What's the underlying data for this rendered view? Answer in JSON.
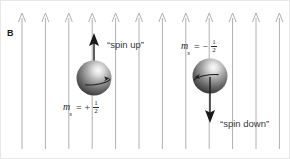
{
  "figure": {
    "panel_letter": "B",
    "background_color": "#ffffff",
    "width": 290,
    "height": 159
  },
  "magnetic_field": {
    "label": "B",
    "line_color": "#b0b0b0",
    "arrow_color": "#a8a8a8",
    "direction": "up",
    "line_count": 11,
    "line_top_y": 12,
    "line_bottom_y": 148,
    "first_line_x": 21,
    "line_spacing": 23.4
  },
  "particles": [
    {
      "id": "spin-up",
      "state_label": "“spin up”",
      "quantum_number": {
        "symbol": "m",
        "subscript": "s",
        "equals": "=",
        "sign": "+",
        "numerator": "1",
        "denominator": "2"
      },
      "sphere": {
        "cx": 93,
        "cy": 77,
        "r": 17,
        "fill_light": "#f2f2f2",
        "fill_mid": "#9a9a9a",
        "fill_dark": "#4a4a4a"
      },
      "moment_arrow": {
        "direction": "up",
        "x": 93,
        "tail_y": 77,
        "head_y": 34,
        "color": "#1a1a1a"
      },
      "rotation_arrow_direction": "right"
    },
    {
      "id": "spin-down",
      "state_label": "“spin down”",
      "quantum_number": {
        "symbol": "m",
        "subscript": "s",
        "equals": "=",
        "sign": "−",
        "numerator": "1",
        "denominator": "2"
      },
      "sphere": {
        "cx": 209,
        "cy": 75,
        "r": 17,
        "fill_light": "#f2f2f2",
        "fill_mid": "#9a9a9a",
        "fill_dark": "#4a4a4a"
      },
      "moment_arrow": {
        "direction": "down",
        "x": 209,
        "tail_y": 75,
        "head_y": 122,
        "color": "#1a1a1a"
      },
      "rotation_arrow_direction": "left"
    }
  ],
  "colors": {
    "text": "#2a2a2a",
    "field_line": "#b0b0b0",
    "arrow_dark": "#1a1a1a",
    "frame": "#e8e8e8"
  }
}
